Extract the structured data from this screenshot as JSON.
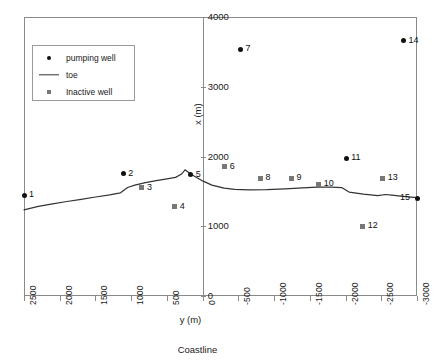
{
  "chart_data": {
    "type": "scatter",
    "title": "",
    "xlabel": "y (m)",
    "ylabel": "x (m)",
    "bottom_caption": "Coastline",
    "xlim": [
      2500,
      -3000
    ],
    "ylim": [
      0,
      4000
    ],
    "x_ticks": [
      "2500",
      "2000",
      "1500",
      "1000",
      "500",
      "0",
      "-500",
      "-1000",
      "-1500",
      "-2000",
      "-2500",
      "-3000"
    ],
    "x_tick_values": [
      2500,
      2000,
      1500,
      1000,
      500,
      0,
      -500,
      -1000,
      -1500,
      -2000,
      -2500,
      -3000
    ],
    "y_ticks": [
      "0",
      "1000",
      "2000",
      "3000",
      "4000"
    ],
    "y_tick_values": [
      0,
      1000,
      2000,
      3000,
      4000
    ],
    "grid": false,
    "legend_position": "upper-left",
    "legend": [
      {
        "label": "pumping well",
        "symbol": "dot",
        "color": "#111111"
      },
      {
        "label": "toe",
        "symbol": "line",
        "color": "#333333"
      },
      {
        "label": "Inactive well",
        "symbol": "square",
        "color": "#777777"
      }
    ],
    "series": [
      {
        "name": "pumping well",
        "symbol": "dot",
        "points": [
          {
            "label": "1",
            "y": 2500,
            "x": 1445,
            "label_side": "right"
          },
          {
            "label": "2",
            "y": 1110,
            "x": 1755,
            "label_side": "right"
          },
          {
            "label": "5",
            "y": 165,
            "x": 1740,
            "label_side": "right"
          },
          {
            "label": "7",
            "y": -530,
            "x": 3535,
            "label_side": "right"
          },
          {
            "label": "11",
            "y": -2010,
            "x": 1975,
            "label_side": "right"
          },
          {
            "label": "14",
            "y": -2810,
            "x": 3660,
            "label_side": "right"
          },
          {
            "label": "15",
            "y": -3000,
            "x": 1400,
            "label_side": "left"
          }
        ]
      },
      {
        "name": "Inactive well",
        "symbol": "square",
        "points": [
          {
            "label": "3",
            "y": 850,
            "x": 1555,
            "label_side": "right"
          },
          {
            "label": "4",
            "y": 390,
            "x": 1280,
            "label_side": "right"
          },
          {
            "label": "6",
            "y": -310,
            "x": 1855,
            "label_side": "right"
          },
          {
            "label": "8",
            "y": -810,
            "x": 1690,
            "label_side": "right"
          },
          {
            "label": "9",
            "y": -1245,
            "x": 1690,
            "label_side": "right"
          },
          {
            "label": "10",
            "y": -1625,
            "x": 1605,
            "label_side": "right"
          },
          {
            "label": "12",
            "y": -2240,
            "x": 1000,
            "label_side": "right"
          },
          {
            "label": "13",
            "y": -2520,
            "x": 1690,
            "label_side": "right"
          }
        ]
      },
      {
        "name": "toe",
        "symbol": "line",
        "points": [
          {
            "y": 2500,
            "x": 1235
          },
          {
            "y": 2300,
            "x": 1285
          },
          {
            "y": 2100,
            "x": 1320
          },
          {
            "y": 1900,
            "x": 1355
          },
          {
            "y": 1700,
            "x": 1385
          },
          {
            "y": 1500,
            "x": 1420
          },
          {
            "y": 1300,
            "x": 1450
          },
          {
            "y": 1150,
            "x": 1480
          },
          {
            "y": 1050,
            "x": 1555
          },
          {
            "y": 950,
            "x": 1590
          },
          {
            "y": 800,
            "x": 1625
          },
          {
            "y": 650,
            "x": 1655
          },
          {
            "y": 500,
            "x": 1680
          },
          {
            "y": 380,
            "x": 1700
          },
          {
            "y": 300,
            "x": 1745
          },
          {
            "y": 245,
            "x": 1810
          },
          {
            "y": 200,
            "x": 1775
          },
          {
            "y": 120,
            "x": 1720
          },
          {
            "y": 0,
            "x": 1650
          },
          {
            "y": -130,
            "x": 1590
          },
          {
            "y": -300,
            "x": 1545
          },
          {
            "y": -450,
            "x": 1528
          },
          {
            "y": -650,
            "x": 1522
          },
          {
            "y": -900,
            "x": 1525
          },
          {
            "y": -1150,
            "x": 1535
          },
          {
            "y": -1400,
            "x": 1550
          },
          {
            "y": -1600,
            "x": 1560
          },
          {
            "y": -1800,
            "x": 1560
          },
          {
            "y": -1950,
            "x": 1552
          },
          {
            "y": -2050,
            "x": 1490
          },
          {
            "y": -2250,
            "x": 1460
          },
          {
            "y": -2450,
            "x": 1440
          },
          {
            "y": -2560,
            "x": 1455
          },
          {
            "y": -2650,
            "x": 1445
          },
          {
            "y": -2800,
            "x": 1430
          },
          {
            "y": -3000,
            "x": 1410
          }
        ]
      }
    ]
  }
}
